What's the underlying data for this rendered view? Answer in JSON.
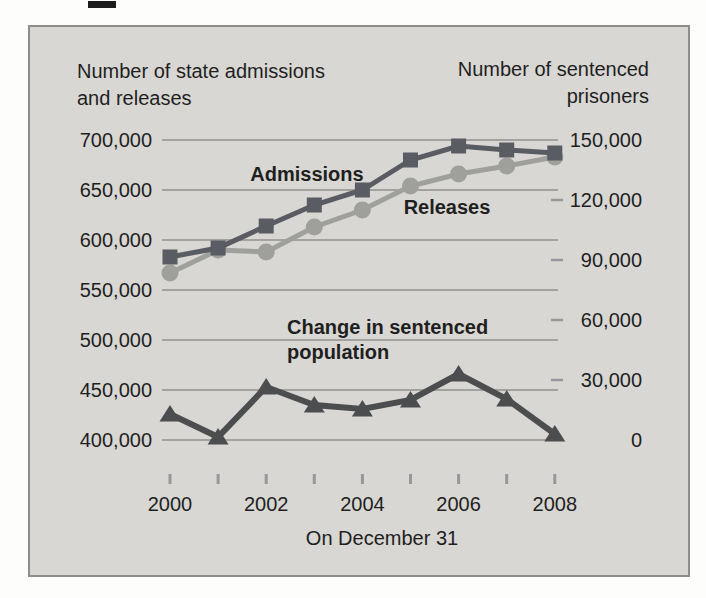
{
  "chart_data": {
    "type": "line",
    "x": [
      2000,
      2001,
      2002,
      2003,
      2004,
      2005,
      2006,
      2007,
      2008
    ],
    "x_axis": {
      "label": "On December 31",
      "tick_labels": [
        "2000",
        "2002",
        "2004",
        "2006",
        "2008"
      ]
    },
    "left_axis": {
      "title_line1": "Number of state admissions",
      "title_line2": "and releases",
      "tick_labels": [
        "700,000",
        "650,000",
        "600,000",
        "550,000",
        "500,000",
        "450,000",
        "400,000"
      ],
      "tick_values": [
        700000,
        650000,
        600000,
        550000,
        500000,
        450000,
        400000
      ],
      "range": [
        400000,
        700000
      ]
    },
    "right_axis": {
      "title_line1": "Number of sentenced",
      "title_line2": "prisoners",
      "tick_labels": [
        "150,000",
        "120,000",
        "90,000",
        "60,000",
        "30,000",
        "0"
      ],
      "tick_values": [
        150000,
        120000,
        90000,
        60000,
        30000,
        0
      ],
      "range": [
        0,
        150000
      ]
    },
    "grid": "horizontal-left-axis",
    "legend": "inline-annotations",
    "series": [
      {
        "name": "Releases",
        "axis": "left",
        "marker": "circle",
        "color": "#9f9f9b",
        "values": [
          567000,
          590000,
          588000,
          613000,
          630000,
          654000,
          666000,
          674000,
          683000
        ]
      },
      {
        "name": "Admissions",
        "axis": "left",
        "marker": "square",
        "color": "#5a5c63",
        "values": [
          583000,
          592000,
          614000,
          635000,
          650000,
          680000,
          694000,
          690000,
          687000
        ]
      },
      {
        "name": "Change in sentenced population",
        "axis": "right",
        "marker": "triangle",
        "color": "#4c4d4f",
        "values": [
          13000,
          1500,
          26500,
          17500,
          15500,
          20000,
          33000,
          20500,
          3000
        ]
      }
    ],
    "series_labels": {
      "admissions": "Admissions",
      "releases": "Releases",
      "change_line1": "Change in sentenced",
      "change_line2": "population"
    },
    "colors": {
      "panel_bg": "#d8d7d3",
      "panel_border": "#8d8d8b",
      "gridline": "#a3a29f",
      "tick": "#97979a",
      "text": "#1f1f1f"
    }
  }
}
